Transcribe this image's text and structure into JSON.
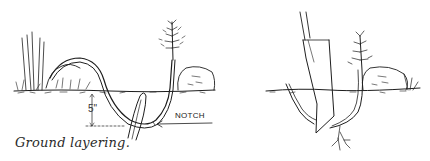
{
  "figure": {
    "caption": "Ground layering.",
    "panels": [
      {
        "id": "left",
        "description": "Branch bent into the ground, notched below soil line, tip upright",
        "labels": {
          "depth": "5\"",
          "notch": "NOTCH"
        }
      },
      {
        "id": "right",
        "description": "Spade severing the rooted layer from the parent plant",
        "labels": {}
      }
    ],
    "colors": {
      "ink": "#1e1e1e",
      "background": "#ffffff"
    }
  }
}
